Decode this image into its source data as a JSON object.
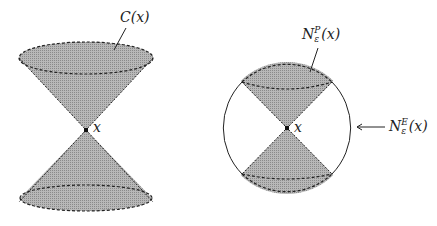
{
  "colors": {
    "fill": "#a9a9a9",
    "stroke": "#222222",
    "background": "#ffffff"
  },
  "left_figure": {
    "cone_label": "C(x)",
    "apex_label": "x"
  },
  "right_figure": {
    "cap_label_base": "N",
    "cap_label_sub": "ε",
    "cap_label_sup": "P",
    "cap_label_arg": "(x)",
    "ball_label_base": "N",
    "ball_label_sub": "ε",
    "ball_label_sup": "E",
    "ball_label_arg": "(x)",
    "apex_label": "x"
  }
}
